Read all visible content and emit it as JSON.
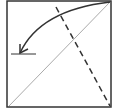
{
  "diagram": {
    "type": "origami-fold-step",
    "square": {
      "x": 7,
      "y": 1,
      "width": 104,
      "height": 106,
      "stroke": "#333333"
    },
    "diagonal_crease": {
      "x1": 9,
      "y1": 106,
      "x2": 110,
      "y2": 2,
      "stroke": "#aaaaaa",
      "style": "thin"
    },
    "valley_fold_line": {
      "x1": 56,
      "y1": 7,
      "x2": 110,
      "y2": 106,
      "stroke": "#333333",
      "style": "dashed"
    },
    "fold_arrow": {
      "path": "M110,2 Q40,10 20,53",
      "stroke": "#333333",
      "direction": "corner-to-left",
      "icon": "curved-arrow-icon"
    },
    "reference_mark": {
      "x1": 11,
      "y1": 54,
      "x2": 36,
      "y2": 54,
      "stroke": "#333333"
    }
  }
}
